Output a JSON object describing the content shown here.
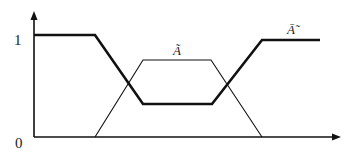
{
  "diagram": {
    "type": "fuzzy-membership-functions",
    "axes": {
      "y_tick_top": "1",
      "y_tick_bottom": "0",
      "x_axis_arrow": true,
      "y_axis_arrow": true
    },
    "curves": [
      {
        "name": "A-tilde",
        "label": "Ã",
        "style": "thin",
        "shape": "trapezoid",
        "points": [
          [
            95,
            137
          ],
          [
            143,
            60
          ],
          [
            211,
            60
          ],
          [
            262,
            137
          ]
        ]
      },
      {
        "name": "A-tilde-complement",
        "label": "Ā̃",
        "style": "bold",
        "shape": "inverted-trapezoid",
        "points": [
          [
            34,
            35
          ],
          [
            95,
            35
          ],
          [
            143,
            104
          ],
          [
            212,
            104
          ],
          [
            262,
            40
          ],
          [
            320,
            40
          ]
        ]
      }
    ],
    "colors": {
      "line": "#111111",
      "background": "#ffffff"
    }
  }
}
